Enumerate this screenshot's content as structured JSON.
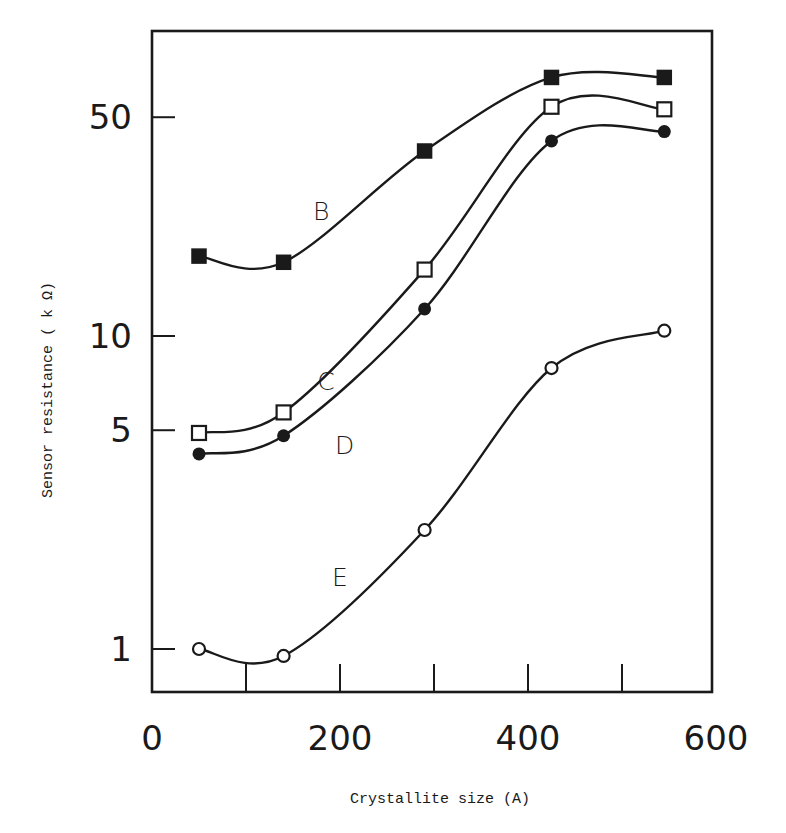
{
  "chart_data": {
    "type": "line",
    "title": "",
    "xlabel": "Crystallite size (A)",
    "ylabel": "Sensor resistance ( k Ω)",
    "xlim": [
      0,
      600
    ],
    "ylim": [
      0.85,
      90
    ],
    "yscale": "log",
    "grid": false,
    "legend": "inline labels",
    "x_ticks": [
      0,
      100,
      200,
      300,
      400,
      500,
      600
    ],
    "x_tick_labels": [
      "0",
      "200",
      "400",
      "600"
    ],
    "y_ticks": [
      1,
      5,
      10,
      50
    ],
    "y_tick_labels": [
      "1",
      "5",
      "10",
      "50"
    ],
    "series": [
      {
        "name": "B",
        "marker": "filled-square",
        "x": [
          50,
          140,
          290,
          425,
          545
        ],
        "values": [
          18,
          17.2,
          39,
          67,
          67
        ]
      },
      {
        "name": "C",
        "marker": "open-square",
        "x": [
          50,
          140,
          290,
          425,
          545
        ],
        "values": [
          4.9,
          5.7,
          16.3,
          54,
          53
        ]
      },
      {
        "name": "D",
        "marker": "filled-circle",
        "x": [
          50,
          140,
          290,
          425,
          545
        ],
        "values": [
          4.2,
          4.8,
          12.2,
          42,
          45
        ]
      },
      {
        "name": "E",
        "marker": "open-circle",
        "x": [
          50,
          140,
          290,
          425,
          545
        ],
        "values": [
          1.0,
          0.95,
          2.4,
          7.9,
          10.4
        ]
      }
    ],
    "series_label_positions": {
      "B": [
        180,
        25
      ],
      "C": [
        185,
        7.2
      ],
      "D": [
        205,
        4.5
      ],
      "E": [
        200,
        1.7
      ]
    }
  }
}
